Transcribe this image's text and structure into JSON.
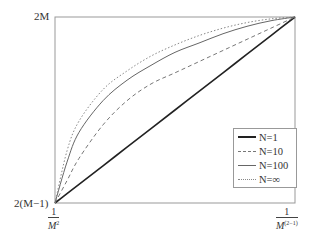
{
  "chart_data": {
    "type": "line",
    "title": "",
    "xlabel": "",
    "ylabel": "",
    "x_ticks": [
      {
        "num": "1",
        "den": "M",
        "exp": "2",
        "position": "left"
      },
      {
        "num": "1",
        "den": "M",
        "exp": "(2-1)",
        "position": "right"
      }
    ],
    "y_ticks": [
      {
        "label": "2M",
        "position": "top"
      },
      {
        "label": "2(M−1)",
        "position": "bottom"
      }
    ],
    "x": [
      0,
      0.05,
      0.1,
      0.2,
      0.3,
      0.4,
      0.5,
      0.6,
      0.7,
      0.8,
      0.9,
      1.0
    ],
    "series": [
      {
        "name": "N=1",
        "style": "solid-thick",
        "values": [
          0,
          0.05,
          0.1,
          0.2,
          0.3,
          0.4,
          0.5,
          0.6,
          0.7,
          0.8,
          0.9,
          1.0
        ]
      },
      {
        "name": "N=10",
        "style": "dashed",
        "values": [
          0,
          0.12,
          0.24,
          0.42,
          0.55,
          0.64,
          0.7,
          0.76,
          0.82,
          0.88,
          0.94,
          1.0
        ]
      },
      {
        "name": "N=100",
        "style": "solid-thin",
        "values": [
          0,
          0.22,
          0.38,
          0.55,
          0.66,
          0.74,
          0.81,
          0.86,
          0.91,
          0.95,
          0.98,
          1.0
        ]
      },
      {
        "name": "N=∞",
        "style": "dotted",
        "values": [
          0,
          0.28,
          0.44,
          0.61,
          0.71,
          0.79,
          0.85,
          0.9,
          0.94,
          0.97,
          0.99,
          1.0
        ]
      }
    ],
    "legend_position": "lower right",
    "grid": false,
    "xlim": [
      0,
      1
    ],
    "ylim": [
      0,
      1
    ]
  },
  "labels": {
    "y_top": "2M",
    "y_bottom": "2(M−1)",
    "x_left_num": "1",
    "x_left_den": "M",
    "x_left_exp": "2",
    "x_right_num": "1",
    "x_right_den": "M",
    "x_right_exp": "(2−1)"
  },
  "legend": {
    "items": [
      {
        "label": "N=1"
      },
      {
        "label": "N=10"
      },
      {
        "label": "N=100"
      },
      {
        "label": "N=∞"
      }
    ]
  }
}
